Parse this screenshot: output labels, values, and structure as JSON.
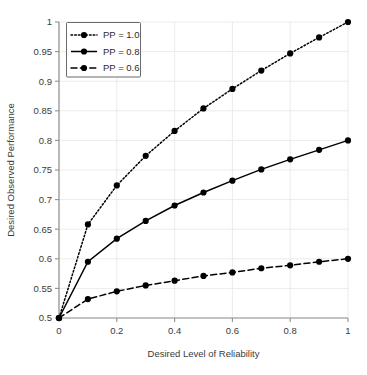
{
  "chart_data": {
    "type": "line",
    "title": "",
    "xlabel": "Desired Level of Reliability",
    "ylabel": "Desired Observed Performance",
    "xlim": [
      0,
      1
    ],
    "ylim": [
      0.5,
      1
    ],
    "grid": true,
    "legend_position": "top-left",
    "x": [
      0,
      0.1,
      0.2,
      0.3,
      0.4,
      0.5,
      0.6,
      0.7,
      0.8,
      0.9,
      1
    ],
    "xticks": [
      "0",
      "0.2",
      "0.4",
      "0.6",
      "0.8",
      "1"
    ],
    "xtick_values": [
      0,
      0.2,
      0.4,
      0.6,
      0.8,
      1
    ],
    "yticks": [
      "0.5",
      "0.55",
      "0.6",
      "0.65",
      "0.7",
      "0.75",
      "0.8",
      "0.85",
      "0.9",
      "0.95",
      "1"
    ],
    "ytick_values": [
      0.5,
      0.55,
      0.6,
      0.65,
      0.7,
      0.75,
      0.8,
      0.85,
      0.9,
      0.95,
      1
    ],
    "series": [
      {
        "name": "PP = 1.0",
        "style": "dotted",
        "marker": "circle",
        "color": "#000000",
        "values": [
          0.5,
          0.658,
          0.724,
          0.774,
          0.816,
          0.854,
          0.887,
          0.918,
          0.947,
          0.974,
          1.0
        ]
      },
      {
        "name": "PP = 0.8",
        "style": "solid",
        "marker": "circle",
        "color": "#000000",
        "values": [
          0.5,
          0.595,
          0.634,
          0.664,
          0.69,
          0.712,
          0.732,
          0.751,
          0.768,
          0.784,
          0.8
        ]
      },
      {
        "name": "PP = 0.6",
        "style": "dashed",
        "marker": "circle",
        "color": "#000000",
        "values": [
          0.5,
          0.532,
          0.545,
          0.555,
          0.563,
          0.571,
          0.577,
          0.584,
          0.589,
          0.595,
          0.6
        ]
      }
    ]
  },
  "legend": {
    "items": [
      {
        "label": "PP = 1.0"
      },
      {
        "label": "PP = 0.8"
      },
      {
        "label": "PP = 0.6"
      }
    ]
  },
  "axes": {
    "x_title": "Desired Level of Reliability",
    "y_title": "Desired Observed Performance"
  }
}
